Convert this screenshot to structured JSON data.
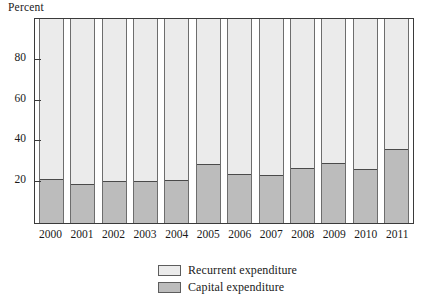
{
  "chart_data": {
    "type": "bar",
    "subtype": "stacked-100-percent",
    "title": "",
    "xlabel": "",
    "ylabel": "Percent",
    "ylim": [
      0,
      100
    ],
    "yticks": [
      20,
      40,
      60,
      80
    ],
    "grid": false,
    "legend_position": "bottom-center",
    "categories": [
      "2000",
      "2001",
      "2002",
      "2003",
      "2004",
      "2005",
      "2006",
      "2007",
      "2008",
      "2009",
      "2010",
      "2011"
    ],
    "series": [
      {
        "name": "Recurrent expenditure",
        "color": "#ebebeb",
        "values": [
          79,
          81.5,
          80,
          80,
          79.5,
          71.5,
          76.5,
          77,
          73.5,
          71,
          74,
          64
        ]
      },
      {
        "name": "Capital expenditure",
        "color": "#bcbcbc",
        "values": [
          21,
          18.5,
          20,
          20,
          20.5,
          28.5,
          23.5,
          23,
          26.5,
          29,
          26,
          36
        ]
      }
    ]
  },
  "axis": {
    "y_title": "Percent",
    "y_tick_labels": [
      "80",
      "60",
      "40",
      "20"
    ],
    "y_tick_values": [
      80,
      60,
      40,
      20
    ]
  },
  "legend": {
    "items": [
      {
        "label": "Recurrent expenditure",
        "swatch": "#ebebeb"
      },
      {
        "label": "Capital expenditure",
        "swatch": "#bcbcbc"
      }
    ]
  }
}
